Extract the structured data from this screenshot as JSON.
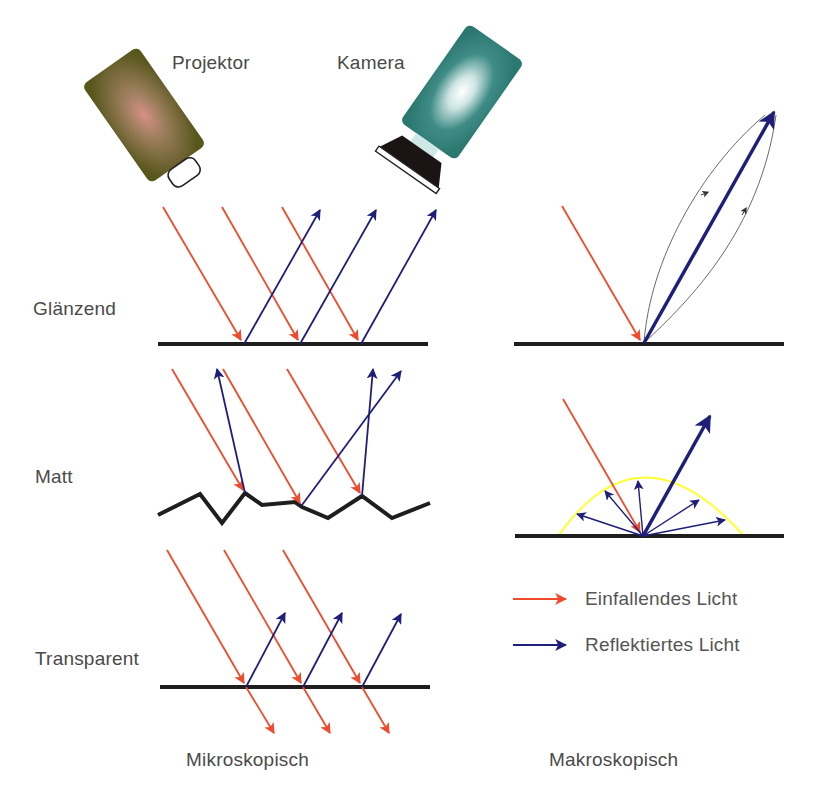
{
  "devices": {
    "projector": {
      "label": "Projektor",
      "body_color": "#5b5a20",
      "glow_color": "#d88f86"
    },
    "camera": {
      "label": "Kamera",
      "body_color": "#2e7f78",
      "glow_color": "#ffffff"
    }
  },
  "rows": [
    {
      "label": "Glänzend"
    },
    {
      "label": "Matt"
    },
    {
      "label": "Transparent"
    }
  ],
  "columns": [
    {
      "label": "Mikroskopisch"
    },
    {
      "label": "Makroskopisch"
    }
  ],
  "legend": {
    "incident": {
      "label": "Einfallendes Licht",
      "color": "#f04a2c"
    },
    "reflected": {
      "label": "Reflektiertes Licht",
      "color": "#1f1f7a"
    }
  },
  "colors": {
    "incident": "#f04a2c",
    "reflected": "#1f1f7a",
    "surface": "#1e1e1e",
    "lobe": "#ffff33",
    "thin_arrow": "#333333"
  }
}
